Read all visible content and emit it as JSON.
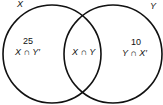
{
  "diagram": {
    "type": "venn",
    "sets": [
      {
        "name": "X",
        "label": "X"
      },
      {
        "name": "Y",
        "label": "Y"
      }
    ],
    "regions": [
      {
        "id": "x_only",
        "count": "25",
        "label": "X ∩ Y′"
      },
      {
        "id": "both",
        "count": "",
        "label": "X ∩ Y"
      },
      {
        "id": "y_only",
        "count": "10",
        "label": "Y ∩ X′"
      }
    ]
  }
}
